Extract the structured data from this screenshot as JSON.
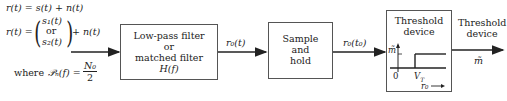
{
  "equations": {
    "line1": "r(t) = s(t) + n(t)",
    "line2_lhs": "r(t) =",
    "line2_s1": "s₁(t)",
    "line2_or": "or",
    "line2_s2": "s₂(t)",
    "line2_rhs": "+ n(t)",
    "line3_where": "where",
    "line3_psd": "𝒫ₙ(f) =",
    "line3_num": "N₀",
    "line3_den": "2"
  },
  "blocks": {
    "filter": {
      "lines": [
        "Low-pass filter",
        "or",
        "matched filter",
        "H(f)"
      ]
    },
    "sample_hold": {
      "lines": [
        "Sample",
        "and",
        "hold"
      ]
    },
    "threshold": {
      "title_lines": [
        "Threshold",
        "device"
      ]
    }
  },
  "signals": {
    "filter_out": "r₀(t)",
    "sample_out": "r₀(t₀)",
    "output_label_lines": [
      "Threshold",
      "device"
    ],
    "output_symbol": "m̃"
  },
  "threshold_plot": {
    "y_label": "m̃",
    "origin": "0",
    "threshold": "V_T",
    "x_label": "r₀"
  },
  "colors": {
    "line": "#222222",
    "box_border": "#555555"
  }
}
